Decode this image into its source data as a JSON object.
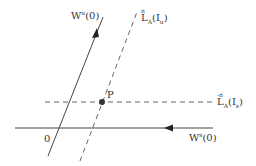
{
  "diagram": {
    "colors": {
      "line": "#444444",
      "dashed": "#666666",
      "point": "#333333",
      "text": "#333333",
      "background": "#ffffff"
    },
    "labels": {
      "unstable_manifold": {
        "base": "W",
        "sup": "u",
        "arg": "(0)"
      },
      "stable_manifold": {
        "base": "W",
        "sup": "s",
        "arg": "(0)"
      },
      "forward_image": {
        "over": "n",
        "base": "L",
        "sub": "A",
        "arg_open": "(I",
        "arg_sub": "u",
        "arg_close": ")"
      },
      "backward_image": {
        "over": "-n",
        "base": "L",
        "sub": "A",
        "arg_open": "(I",
        "arg_sub": "s",
        "arg_close": ")"
      },
      "point_p": "P",
      "origin": "0"
    },
    "elements": {
      "unstable_line": {
        "x1": 48,
        "y1": 156,
        "x2": 103,
        "y2": 17,
        "style": "solid",
        "arrow": "up"
      },
      "stable_line": {
        "x1": 15,
        "y1": 128,
        "x2": 213,
        "y2": 128,
        "style": "solid",
        "arrow": "left"
      },
      "forward_dashed": {
        "x1": 80,
        "y1": 161,
        "x2": 137,
        "y2": 12,
        "style": "dashed"
      },
      "backward_dashed": {
        "x1": 45,
        "y1": 102,
        "x2": 212,
        "y2": 102,
        "style": "dashed"
      },
      "point": {
        "cx": 102,
        "cy": 102,
        "r": 3
      }
    }
  }
}
